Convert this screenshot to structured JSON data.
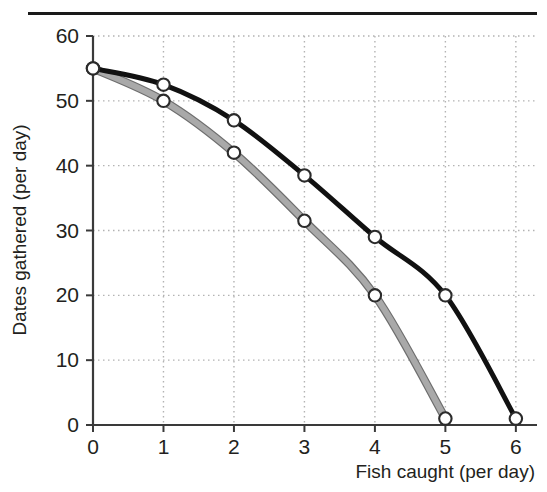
{
  "figure": {
    "top_rule": "horizontal-rule",
    "background_color": "#ffffff"
  },
  "chart_data": {
    "type": "line",
    "title": "",
    "xlabel": "Fish caught (per day)",
    "ylabel": "Dates gathered (per day)",
    "xlim": [
      0,
      6.3
    ],
    "ylim": [
      0,
      60
    ],
    "xticks": [
      0,
      1,
      2,
      3,
      4,
      5,
      6
    ],
    "xtick_labels": [
      "0",
      "1",
      "2",
      "3",
      "4",
      "5",
      "6"
    ],
    "yticks": [
      0,
      10,
      20,
      30,
      40,
      50,
      60
    ],
    "ytick_labels": [
      "0",
      "10",
      "20",
      "30",
      "40",
      "50",
      "60"
    ],
    "grid": true,
    "grid_style": "dotted",
    "grid_color": "#b3b3b3",
    "legend": "none",
    "marker": "open-circle",
    "marker_face_color": "#ffffff",
    "series": [
      {
        "name": "outer-frontier",
        "color": "#111111",
        "line_width": 5,
        "x": [
          0,
          1,
          2,
          3,
          4,
          5,
          6
        ],
        "values": [
          55,
          52.5,
          47,
          38.5,
          29,
          20,
          1
        ]
      },
      {
        "name": "inner-frontier",
        "color": "#a9a9a9",
        "outline_color": "#6e6e6e",
        "line_width": 6,
        "x": [
          0,
          1,
          2,
          3,
          4,
          5
        ],
        "values": [
          55,
          50,
          42,
          31.5,
          20,
          1
        ]
      }
    ]
  }
}
